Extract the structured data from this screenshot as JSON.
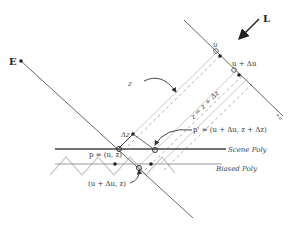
{
  "diagram": {
    "labels": {
      "eye": "E",
      "light": "L",
      "u": "u",
      "u_du": "u + Δu",
      "axis_u": "+u",
      "z": "z",
      "z_prime": "z = z + Δz",
      "dz": "Δz",
      "p": "p = (u, z)",
      "p_prime": "p' = (u + Δu, z + Δz)",
      "biased_point": "(u + Δu, z)",
      "scene_poly": "Scene Poly",
      "biased_poly": "Biased Poly"
    },
    "colors": {
      "line": "#555555",
      "light_gray": "#bbbbbb",
      "scene_poly": "#444444",
      "biased_poly": "#999999",
      "zigzag": "#cccccc"
    }
  }
}
